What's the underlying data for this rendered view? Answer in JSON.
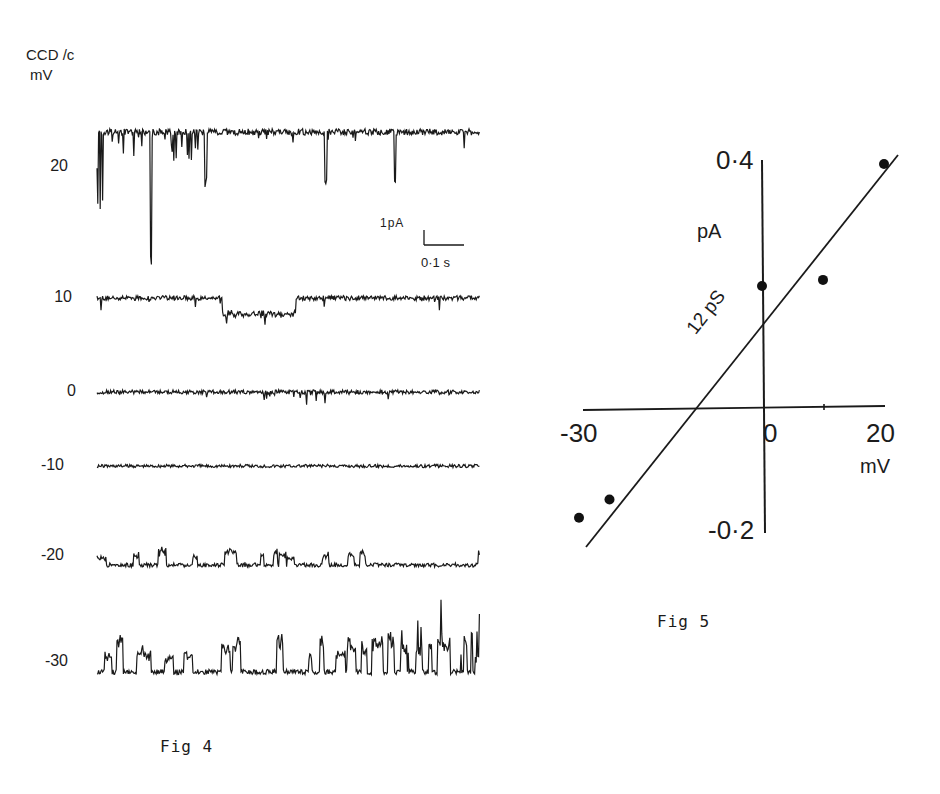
{
  "fig4": {
    "ylabel_line1": "CCD /c",
    "ylabel_line2": "mV",
    "caption": "Fig 4",
    "scale_bar": {
      "current": "1pA",
      "time": "0·1 s"
    },
    "traces": [
      {
        "label": "20",
        "y": 132,
        "baseline": 132,
        "direction": "down",
        "noise": 3.2,
        "seed": 11
      },
      {
        "label": "10",
        "y": 298,
        "baseline": 298,
        "direction": "down",
        "noise": 2.4,
        "seed": 23
      },
      {
        "label": "0",
        "y": 392,
        "baseline": 392,
        "direction": "down",
        "noise": 2.0,
        "seed": 37
      },
      {
        "label": "-10",
        "y": 466,
        "baseline": 466,
        "direction": "none",
        "noise": 1.6,
        "seed": 41
      },
      {
        "label": "-20",
        "y": 565,
        "baseline": 565,
        "direction": "up",
        "noise": 2.0,
        "seed": 53
      },
      {
        "label": "-30",
        "y": 672,
        "baseline": 672,
        "direction": "up",
        "noise": 2.6,
        "seed": 67
      }
    ]
  },
  "fig5": {
    "caption": "Fig 5",
    "x_ticks": [
      "-30",
      "0",
      "20"
    ],
    "x_unit": "mV",
    "y_ticks": [
      "0·4",
      "-0·2"
    ],
    "y_unit": "pA",
    "fit_label": "12 pS"
  },
  "chart_data": [
    {
      "type": "line",
      "title": "Fig 4",
      "description": "Single-channel current recordings at holding potentials",
      "ylabel": "CCD /c mV",
      "series": [
        {
          "name": "20 mV",
          "behavior": "downward openings from baseline, large transients early"
        },
        {
          "name": "10 mV",
          "behavior": "downward openings, sustained sub-level ~0.3 pA"
        },
        {
          "name": "0 mV",
          "behavior": "small downward events"
        },
        {
          "name": "-10 mV",
          "behavior": "flat, near reversal"
        },
        {
          "name": "-20 mV",
          "behavior": "small upward openings"
        },
        {
          "name": "-30 mV",
          "behavior": "frequent upward openings"
        }
      ],
      "scale_bar": {
        "current_pA": 1,
        "time_s": 0.1
      }
    },
    {
      "type": "scatter",
      "title": "Fig 5",
      "xlabel": "mV",
      "ylabel": "pA",
      "x": [
        -30,
        -25,
        0,
        10,
        20
      ],
      "y": [
        -0.18,
        -0.15,
        0.2,
        0.21,
        0.4
      ],
      "xlim": [
        -30,
        20
      ],
      "ylim": [
        -0.2,
        0.4
      ],
      "fit": {
        "label": "12 pS",
        "slope_pS": 12,
        "x_intercept_mV": -11
      },
      "grid": false
    }
  ]
}
